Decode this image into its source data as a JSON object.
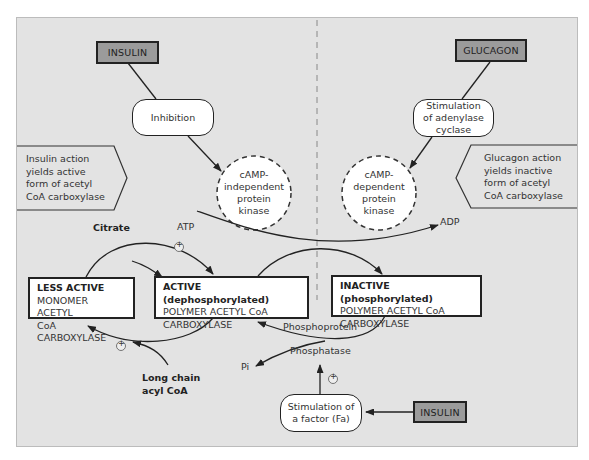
{
  "diagram": {
    "hormones": {
      "insulin_top": "INSULIN",
      "glucagon_top": "GLUCAGON",
      "insulin_bottom": "INSULIN"
    },
    "actions": {
      "inhibition": "Inhibition",
      "stim_adenylase_1": "Stimulation",
      "stim_adenylase_2": "of adenylase",
      "stim_adenylase_3": "cyclase",
      "stim_factor_1": "Stimulation of",
      "stim_factor_2": "a factor (Fa)"
    },
    "kinases": {
      "independent": [
        "cAMP-",
        "independent",
        "protein",
        "kinase"
      ],
      "dependent": [
        "cAMP-",
        "dependent",
        "protein",
        "kinase"
      ]
    },
    "callouts": {
      "insulin": [
        "Insulin action",
        "yields active",
        "form of acetyl",
        "CoA carboxylase"
      ],
      "glucagon": [
        "Glucagon action",
        "yields inactive",
        "form  of acetyl",
        "CoA carboxylase"
      ]
    },
    "enzyme_states": {
      "less_active": {
        "heading": "LESS ACTIVE",
        "line1": "MONOMER ACETYL",
        "line2": "CoA CARBOXYLASE"
      },
      "active": {
        "heading": "ACTIVE (dephosphorylated)",
        "line1": "POLYMER ACETYL CoA",
        "line2": "CARBOXYLASE"
      },
      "inactive": {
        "heading": "INACTIVE (phosphorylated)",
        "line1": "POLYMER ACETYL CoA",
        "line2": "CARBOXYLASE"
      }
    },
    "labels": {
      "citrate": "Citrate",
      "atp": "ATP",
      "adp": "ADP",
      "phosphoprotein": "Phosphoprotein",
      "phosphatase": "Phosphatase",
      "pi": "Pi",
      "long_chain_1": "Long chain",
      "long_chain_2": "acyl CoA",
      "plus": "+"
    },
    "colors": {
      "panel_bg": "#e3e3e3",
      "hormone_fill": "#9b9b9b",
      "stroke": "#222222",
      "box_fill": "#ffffff"
    }
  }
}
